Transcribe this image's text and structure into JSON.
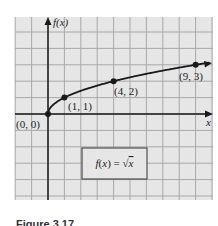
{
  "chart_data": {
    "type": "line",
    "title": "",
    "function_label": "f(x) = √x",
    "xlabel": "x",
    "ylabel": "f(x)",
    "xlim": [
      -2,
      10
    ],
    "ylim": [
      -5,
      6
    ],
    "grid": true,
    "legend_position": "none",
    "series": [
      {
        "name": "f(x) = √x",
        "x": [
          0,
          1,
          4,
          9
        ],
        "y": [
          0,
          1,
          2,
          3
        ]
      }
    ],
    "annotations": [
      {
        "label": "(0, 0)",
        "x": 0,
        "y": 0
      },
      {
        "label": "(1, 1)",
        "x": 1,
        "y": 1
      },
      {
        "label": "(4, 2)",
        "x": 4,
        "y": 2
      },
      {
        "label": "(9, 3)",
        "x": 9,
        "y": 3
      }
    ]
  },
  "labels": {
    "y_axis": "f(x)",
    "x_axis": "x",
    "pt0": "(0, 0)",
    "pt1": "(1, 1)",
    "pt2": "(4, 2)",
    "pt3": "(9, 3)",
    "formula_left": "f(x) = ",
    "formula_sqrt": "√",
    "formula_var": "x"
  },
  "caption": "Figure 3.17",
  "colors": {
    "grid_bg": "#e6e6e6",
    "grid_line": "#a8a8a8",
    "axis": "#1a1a1a",
    "curve": "#1a1a1a"
  }
}
